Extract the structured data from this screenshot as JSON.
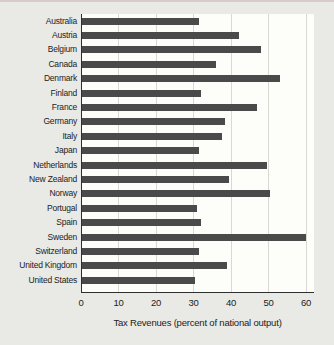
{
  "chart_data": {
    "type": "bar",
    "orientation": "horizontal",
    "title": "",
    "xlabel": "Tax Revenues (percent of national output)",
    "ylabel": "",
    "categories": [
      "Australia",
      "Austria",
      "Belgium",
      "Canada",
      "Denmark",
      "Finland",
      "France",
      "Germany",
      "Italy",
      "Japan",
      "Netherlands",
      "New Zealand",
      "Norway",
      "Portugal",
      "Spain",
      "Sweden",
      "Switzerland",
      "United Kingdom",
      "United States"
    ],
    "values": [
      31.5,
      42,
      48,
      36,
      53,
      32,
      47,
      38.5,
      37.5,
      31.5,
      49.5,
      39.5,
      50.5,
      31,
      32,
      60,
      31.5,
      39,
      30.5
    ],
    "xticks": [
      0,
      10,
      20,
      30,
      40,
      50,
      60
    ],
    "xlim": [
      0,
      62
    ],
    "grid": true,
    "legend": false,
    "bar_color": "#4a4a4a",
    "plot_bg": "#fdfdfa",
    "page_bg": "#e9e9e5",
    "gridline_color": "#d9d9d3",
    "axis_color": "#2f2f2f",
    "top_rule_color": "#d9cbcb"
  }
}
